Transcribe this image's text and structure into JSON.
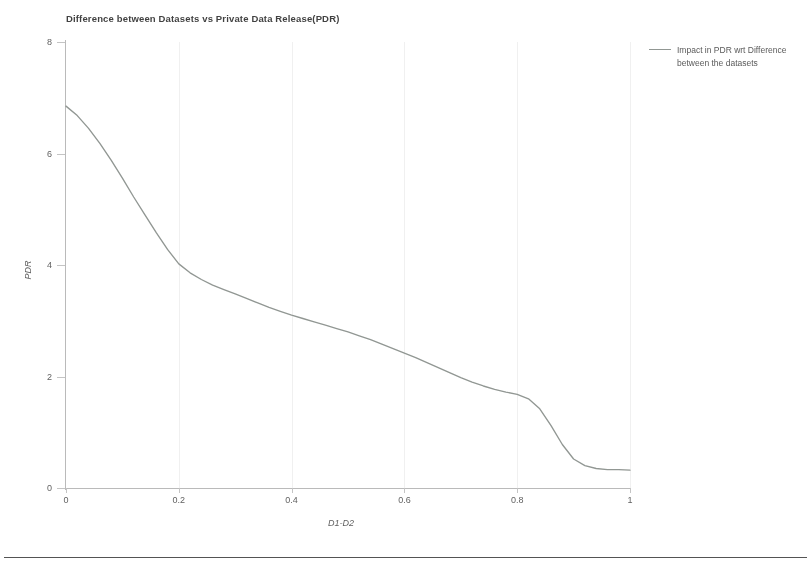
{
  "chart_data": {
    "type": "line",
    "title": "Difference between Datasets vs Private Data Release(PDR)",
    "xlabel": "D1-D2",
    "ylabel": "PDR",
    "xlim": [
      0,
      1
    ],
    "ylim": [
      0,
      8
    ],
    "xticks": [
      "0",
      "0.2",
      "0.4",
      "0.6",
      "0.8",
      "1"
    ],
    "xtick_values": [
      0,
      0.2,
      0.4,
      0.6,
      0.8,
      1
    ],
    "yticks": [
      "0",
      "2",
      "4",
      "6",
      "8"
    ],
    "ytick_values": [
      0,
      2,
      4,
      6,
      8
    ],
    "grid": "light vertical gridlines only",
    "legend_position": "right outside",
    "line_color": "#8e9490",
    "series": [
      {
        "name": "Impact in PDR wrt Difference between the datasets",
        "x": [
          0.0,
          0.02,
          0.04,
          0.06,
          0.08,
          0.1,
          0.12,
          0.14,
          0.16,
          0.18,
          0.2,
          0.22,
          0.24,
          0.26,
          0.28,
          0.3,
          0.32,
          0.34,
          0.36,
          0.38,
          0.4,
          0.42,
          0.44,
          0.46,
          0.48,
          0.5,
          0.52,
          0.54,
          0.56,
          0.58,
          0.6,
          0.62,
          0.64,
          0.66,
          0.68,
          0.7,
          0.72,
          0.74,
          0.76,
          0.78,
          0.8,
          0.82,
          0.84,
          0.86,
          0.88,
          0.9,
          0.92,
          0.94,
          0.96,
          0.98,
          1.0
        ],
        "y": [
          6.85,
          6.68,
          6.45,
          6.18,
          5.88,
          5.56,
          5.22,
          4.9,
          4.58,
          4.28,
          4.02,
          3.86,
          3.74,
          3.64,
          3.56,
          3.48,
          3.4,
          3.32,
          3.24,
          3.17,
          3.1,
          3.04,
          2.98,
          2.92,
          2.86,
          2.8,
          2.73,
          2.66,
          2.58,
          2.5,
          2.42,
          2.34,
          2.25,
          2.16,
          2.07,
          1.98,
          1.9,
          1.83,
          1.77,
          1.72,
          1.68,
          1.6,
          1.42,
          1.12,
          0.78,
          0.52,
          0.4,
          0.35,
          0.33,
          0.33,
          0.32
        ]
      }
    ]
  },
  "chart": {
    "title": "Difference between Datasets vs Private Data Release(PDR)",
    "axis_label_x": "D1-D2",
    "axis_label_y": "PDR",
    "xtick_labels": [
      "0",
      "0.2",
      "0.4",
      "0.6",
      "0.8",
      "1"
    ],
    "ytick_labels": [
      "0",
      "2",
      "4",
      "6",
      "8"
    ]
  },
  "legend": {
    "series_label": "Impact in PDR wrt Difference between the datasets"
  }
}
